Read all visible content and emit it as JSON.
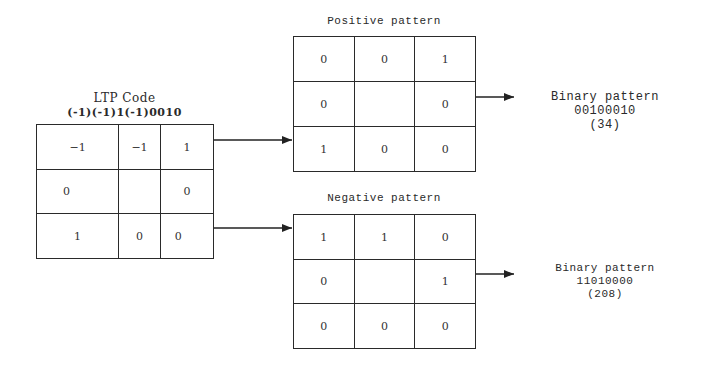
{
  "ltp": {
    "title": "LTP Code",
    "code": "(-1)(-1)1(-1)0010",
    "cells": [
      [
        "−1",
        "−1",
        "1"
      ],
      [
        "0",
        "",
        "0"
      ],
      [
        "1",
        "0",
        "0"
      ]
    ]
  },
  "positive": {
    "title": "Positive pattern",
    "cells": [
      [
        "0",
        "0",
        "1"
      ],
      [
        "0",
        "",
        "0"
      ],
      [
        "1",
        "0",
        "0"
      ]
    ],
    "binary_label": "Binary pattern",
    "binary_value": "00100010",
    "decimal": "(34)"
  },
  "negative": {
    "title": "Negative pattern",
    "cells": [
      [
        "1",
        "1",
        "0"
      ],
      [
        "0",
        "",
        "1"
      ],
      [
        "0",
        "0",
        "0"
      ]
    ],
    "binary_label": "Binary pattern",
    "binary_value": "11010000",
    "decimal": "(208)"
  }
}
